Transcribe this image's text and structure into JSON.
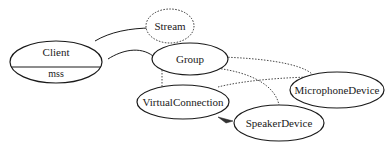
{
  "diagram": {
    "nodes": {
      "client": {
        "label": "Client",
        "sublabel": "mss"
      },
      "stream": {
        "label": "Stream"
      },
      "group": {
        "label": "Group"
      },
      "virtual_connection": {
        "label": "VirtualConnection"
      },
      "microphone_device": {
        "label": "MicrophoneDevice"
      },
      "speaker_device": {
        "label": "SpeakerDevice"
      }
    },
    "edges": [
      {
        "from": "Client",
        "to": "Stream",
        "style": "solid"
      },
      {
        "from": "Client",
        "to": "Group",
        "style": "solid"
      },
      {
        "from": "Group",
        "to": "VirtualConnection",
        "style": "dotted"
      },
      {
        "from": "Group",
        "to": "MicrophoneDevice",
        "style": "dotted"
      },
      {
        "from": "Group",
        "to": "SpeakerDevice",
        "style": "dotted"
      },
      {
        "from": "VirtualConnection",
        "to": "MicrophoneDevice",
        "style": "dotted"
      },
      {
        "from": "SpeakerDevice",
        "to": "VirtualConnection",
        "style": "solid-arrow"
      }
    ],
    "colors": {
      "stroke": "#1a1a1a",
      "background": "#ffffff"
    }
  }
}
